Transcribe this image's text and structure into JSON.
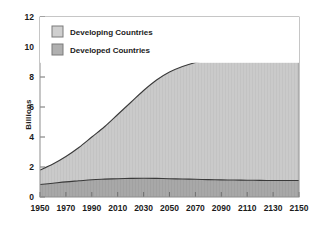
{
  "chart_data": {
    "type": "area",
    "title": "",
    "subtitle": "",
    "xlabel": "",
    "ylabel": "Billions",
    "stacked": true,
    "grid": false,
    "legend_position": "top-left-inside",
    "xlim": [
      1950,
      2150
    ],
    "ylim": [
      0,
      12
    ],
    "xticks": [
      1950,
      1970,
      1990,
      2010,
      2030,
      2050,
      2070,
      2090,
      2110,
      2130,
      2150
    ],
    "yticks": [
      0,
      2,
      4,
      6,
      8,
      10,
      12
    ],
    "xtick_labels": [
      "1950",
      "1970",
      "1990",
      "2010",
      "2030",
      "2050",
      "2070",
      "2090",
      "2110",
      "2130",
      "2150"
    ],
    "ytick_labels": [
      "0",
      "2",
      "4",
      "6",
      "8",
      "10",
      "12"
    ],
    "x": [
      1950,
      1960,
      1970,
      1980,
      1990,
      2000,
      2010,
      2020,
      2030,
      2040,
      2050,
      2060,
      2070,
      2080,
      2090,
      2100,
      2110,
      2120,
      2130,
      2140,
      2150
    ],
    "series": [
      {
        "name": "Developed Countries",
        "color": "#a8a8a8",
        "values": [
          0.83,
          0.92,
          1.01,
          1.08,
          1.15,
          1.19,
          1.22,
          1.24,
          1.25,
          1.24,
          1.22,
          1.2,
          1.18,
          1.16,
          1.14,
          1.13,
          1.12,
          1.11,
          1.1,
          1.1,
          1.1
        ]
      },
      {
        "name": "Developing Countries",
        "color": "#cacaca",
        "values": [
          0.97,
          1.28,
          1.69,
          2.22,
          2.85,
          3.51,
          4.28,
          5.06,
          5.85,
          6.56,
          7.11,
          7.5,
          7.79,
          8.0,
          8.16,
          8.29,
          8.4,
          8.47,
          8.52,
          8.56,
          8.6
        ]
      }
    ],
    "totals": [
      1.8,
      2.2,
      2.7,
      3.3,
      4.0,
      4.7,
      5.5,
      6.3,
      7.1,
      7.8,
      8.33,
      8.7,
      8.97,
      9.16,
      9.3,
      9.42,
      9.52,
      9.58,
      9.62,
      9.66,
      9.7
    ]
  },
  "legend": {
    "items": [
      {
        "label": "Developing Countries",
        "swatch": "#cfcfcf"
      },
      {
        "label": "Developed Countries",
        "swatch": "#b0b0b0"
      }
    ]
  },
  "axis": {
    "y_title": "Billions"
  },
  "colors": {
    "developing_fill": "#cacaca",
    "developed_fill": "#a8a8a8",
    "line": "#3a3a3a",
    "frame": "#8e8e8e",
    "text": "#1b1b1b",
    "background": "#ffffff"
  }
}
